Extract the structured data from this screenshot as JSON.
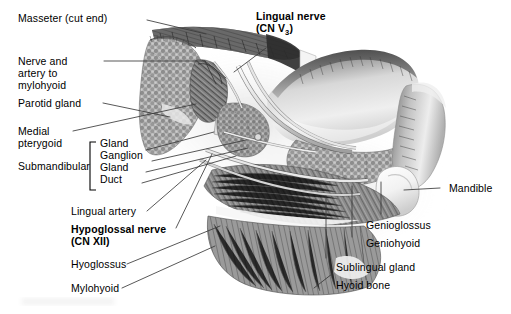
{
  "figure": {
    "kind": "anatomical-illustration",
    "style": "grayscale pencil/airbrush medical illustration on white background",
    "background_color": "#ffffff",
    "ink_color": "#000000",
    "leader_line_color": "#3a3a3a"
  },
  "labels": {
    "masseter": "Masseter (cut end)",
    "nerve_artery_mylohyoid": [
      "Nerve and",
      "artery to",
      "mylohyoid"
    ],
    "parotid_gland": "Parotid gland",
    "medial_pterygoid": [
      "Medial",
      "pterygoid"
    ],
    "submandibular": "Submandibular",
    "submandibular_items": [
      "Gland",
      "Ganglion",
      "Gland",
      "Duct"
    ],
    "lingual_artery": "Lingual artery",
    "hypoglossal_nerve": [
      "Hypoglossal nerve",
      "(CN XII)"
    ],
    "hyoglossus": "Hyoglossus",
    "mylohyoid": "Mylohyoid",
    "lingual_nerve_line1": "Lingual nerve",
    "lingual_nerve_line2_pre": "(CN V",
    "lingual_nerve_line2_sub": "3",
    "lingual_nerve_line2_post": ")",
    "mandible": "Mandible",
    "genioglossus": "Genioglossus",
    "geniohyoid": "Geniohyoid",
    "sublingual_gland": "Sublingual gland",
    "hyoid_bone": "Hyoid bone"
  },
  "emphasis": {
    "bold_labels": [
      "Lingual nerve (CN V3)",
      "Hypoglossal nerve (CN XII)"
    ],
    "bracketed_group": "Submandibular"
  }
}
